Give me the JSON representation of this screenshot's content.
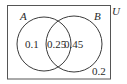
{
  "diagram": {
    "type": "venn",
    "universe": {
      "label": "U",
      "outside_value": "0.2"
    },
    "sets": [
      {
        "label": "A",
        "only_value": "0.1"
      },
      {
        "label": "B",
        "only_value": "0.45"
      }
    ],
    "intersection": {
      "label": "A∩B",
      "value": "0.25"
    },
    "colors": {
      "stroke": "#3a3a3a",
      "text": "#2a2a2a",
      "background": "#ffffff"
    }
  }
}
